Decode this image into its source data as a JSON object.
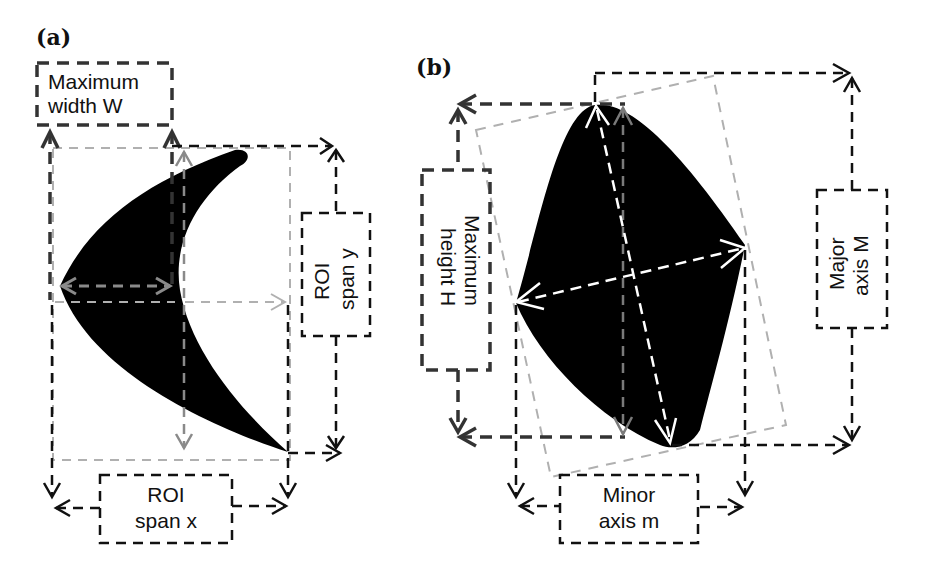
{
  "figure": {
    "background": "#ffffff",
    "colors": {
      "shape_fill": "#000000",
      "dark_dash": "#111111",
      "mid_dash": "#333333",
      "light_gray_dash": "#b0b0b0",
      "gray_arrow": "#8a8a8a",
      "white_arrow": "#ffffff"
    },
    "panel_a": {
      "label": "(a)",
      "shape": "crescent (boomerang) silhouette",
      "boxes": {
        "max_width": {
          "line1": "Maximum",
          "line2": "width W"
        },
        "roi_span_y": {
          "line1": "ROI",
          "line2": "span y"
        },
        "roi_span_x": {
          "line1": "ROI",
          "line2": "span x"
        }
      }
    },
    "panel_b": {
      "label": "(b)",
      "shape": "rounded quadrilateral (rotated ellipse-like) silhouette",
      "boxes": {
        "max_height": {
          "line1": "Maximum",
          "line2": "height H"
        },
        "major_axis": {
          "line1": "Major",
          "line2": "axis M"
        },
        "minor_axis": {
          "line1": "Minor",
          "line2": "axis m"
        }
      }
    }
  }
}
